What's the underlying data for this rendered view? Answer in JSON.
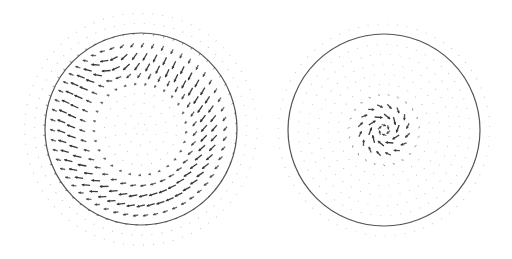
{
  "figure": {
    "panels": [
      {
        "id": "left",
        "description": "vortex ring vector field",
        "circle": {
          "cx": 141,
          "cy": 129,
          "r": 96,
          "stroke": "#555555"
        },
        "field": {
          "type": "ring-vortex",
          "grid_step": 10,
          "extent": 120,
          "peak_radius": 70,
          "width": 22,
          "max_len": 9,
          "arrow_color": "#333333"
        }
      },
      {
        "id": "right",
        "description": "central swirl vector field",
        "circle": {
          "cx": 384,
          "cy": 130,
          "r": 96,
          "stroke": "#555555"
        },
        "field": {
          "type": "central-swirl",
          "grid_step": 10,
          "extent": 115,
          "peak_radius": 18,
          "width": 16,
          "max_len": 8,
          "arrow_color": "#333333"
        }
      }
    ]
  }
}
